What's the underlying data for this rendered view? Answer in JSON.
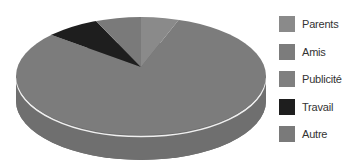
{
  "chart_data": {
    "type": "pie",
    "style": "3d",
    "title": "",
    "categories": [
      "Parents",
      "Amis",
      "Publicité",
      "Travail",
      "Autre"
    ],
    "values": [
      5,
      82,
      0,
      7,
      6
    ],
    "unit": "%",
    "legend_position": "right",
    "colors": [
      "#8a8a8a",
      "#7c7c7c",
      "#7f7f7f",
      "#1e1e1e",
      "#7a7a7a"
    ]
  },
  "legend": {
    "items": [
      {
        "label": "Parents",
        "color": "#8a8a8a"
      },
      {
        "label": "Amis",
        "color": "#7c7c7c"
      },
      {
        "label": "Publicité",
        "color": "#7f7f7f"
      },
      {
        "label": "Travail",
        "color": "#1e1e1e"
      },
      {
        "label": "Autre",
        "color": "#7a7a7a"
      }
    ]
  },
  "style": {
    "side_color": "#6f6f6f",
    "rim_color": "#f0f0f0"
  }
}
